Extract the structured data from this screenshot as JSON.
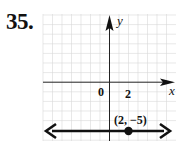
{
  "problem": {
    "number": "35."
  },
  "graph": {
    "x_axis_label": "x",
    "y_axis_label": "y",
    "origin_label": "0",
    "x_tick_label": "2",
    "point_label": "(2, −5)",
    "point": {
      "x": 2,
      "y": -5
    },
    "line": {
      "type": "horizontal",
      "equation": "y = -5",
      "arrows": "both"
    },
    "grid_unit": 1
  }
}
